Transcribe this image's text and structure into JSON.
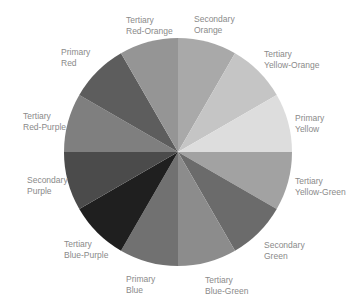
{
  "diagram": {
    "type": "color-wheel",
    "center": [
      178,
      152
    ],
    "radius": 114,
    "segments": [
      {
        "key": "secondary-orange",
        "line1": "Secondary",
        "line2": "Orange",
        "start": 0,
        "fill": "#a9a9a9",
        "label_pos": [
          194,
          14
        ]
      },
      {
        "key": "tertiary-yellow-orange",
        "line1": "Tertiary",
        "line2": "Yellow-Orange",
        "start": 30,
        "fill": "#c5c5c5",
        "label_pos": [
          264,
          49
        ]
      },
      {
        "key": "primary-yellow",
        "line1": "Primary",
        "line2": "Yellow",
        "start": 60,
        "fill": "#dddddd",
        "label_pos": [
          295,
          113
        ]
      },
      {
        "key": "tertiary-yellow-green",
        "line1": "Tertiary",
        "line2": "Yellow-Green",
        "start": 90,
        "fill": "#a2a2a2",
        "label_pos": [
          295,
          176
        ]
      },
      {
        "key": "secondary-green",
        "line1": "Secondary",
        "line2": "Green",
        "start": 120,
        "fill": "#6b6b6b",
        "label_pos": [
          264,
          240
        ]
      },
      {
        "key": "tertiary-blue-green",
        "line1": "Tertiary",
        "line2": "Blue-Green",
        "start": 150,
        "fill": "#8c8c8c",
        "label_pos": [
          205,
          275
        ]
      },
      {
        "key": "primary-blue",
        "line1": "Primary",
        "line2": "Blue",
        "start": 180,
        "fill": "#717171",
        "label_pos": [
          126,
          274
        ]
      },
      {
        "key": "tertiary-blue-purple",
        "line1": "Tertiary",
        "line2": "Blue-Purple",
        "start": 210,
        "fill": "#1f1f1f",
        "label_pos": [
          64,
          239
        ]
      },
      {
        "key": "secondary-purple",
        "line1": "Secondary",
        "line2": "Purple",
        "start": 240,
        "fill": "#4b4b4b",
        "label_pos": [
          27,
          175
        ]
      },
      {
        "key": "tertiary-red-purple",
        "line1": "Tertiary",
        "line2": "Red-Purple",
        "start": 270,
        "fill": "#7f7f7f",
        "label_pos": [
          23,
          111
        ]
      },
      {
        "key": "primary-red",
        "line1": "Primary",
        "line2": "Red",
        "start": 300,
        "fill": "#5d5d5d",
        "label_pos": [
          61,
          47
        ]
      },
      {
        "key": "tertiary-red-orange",
        "line1": "Tertiary",
        "line2": "Red-Orange",
        "start": 330,
        "fill": "#959595",
        "label_pos": [
          126,
          15
        ]
      }
    ]
  }
}
